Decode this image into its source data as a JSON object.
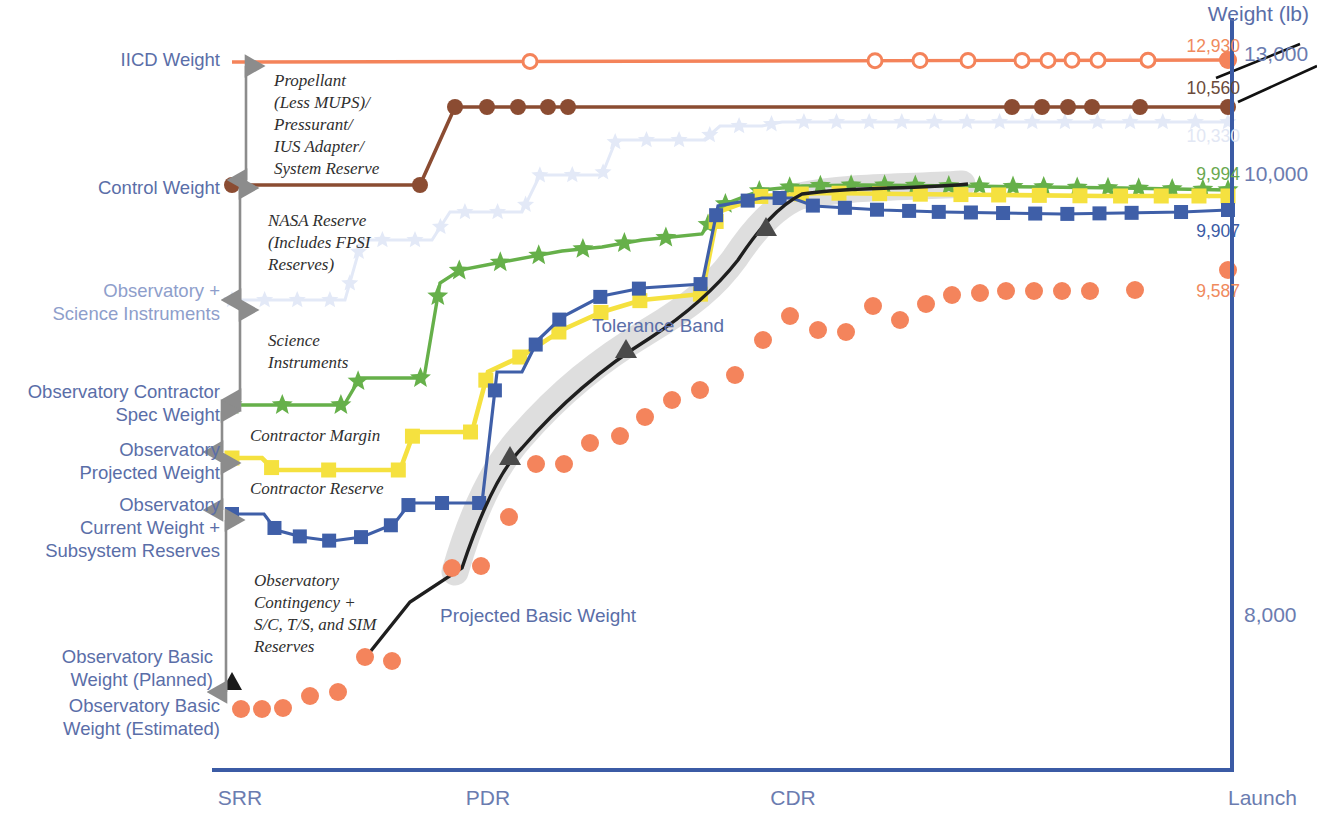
{
  "figure": {
    "axis_title": "Weight (lb)",
    "y_ticks": [
      {
        "label": "13,000",
        "y": 56
      },
      {
        "label": "10,000",
        "y": 176
      },
      {
        "label": "8,000",
        "y": 617
      }
    ],
    "x_ticks": [
      {
        "label": "SRR",
        "x": 240
      },
      {
        "label": "PDR",
        "x": 488
      },
      {
        "label": "CDR",
        "x": 793
      },
      {
        "label": "Launch",
        "x": 1258
      }
    ],
    "axis_color": "#3b5ba5"
  },
  "series_labels": [
    {
      "name": "iicd-weight",
      "text": "IICD Weight",
      "x": 28,
      "y": 48,
      "w": 192,
      "align": "right",
      "color": "#5a6ea8"
    },
    {
      "name": "control-weight",
      "text": "Control Weight",
      "x": 28,
      "y": 176,
      "w": 192,
      "align": "right",
      "color": "#5a6ea8"
    },
    {
      "name": "observatory-plus-si",
      "text": "Observatory +\nScience Instruments",
      "x": 0,
      "y": 279,
      "w": 220,
      "align": "right",
      "color": "#8e9ecb"
    },
    {
      "name": "contractor-spec-weight",
      "text": "Observatory Contractor\nSpec Weight",
      "x": 0,
      "y": 380,
      "w": 220,
      "align": "right",
      "color": "#5a6ea8"
    },
    {
      "name": "projected-weight",
      "text": "Observatory\nProjected Weight",
      "x": 0,
      "y": 438,
      "w": 220,
      "align": "right",
      "color": "#5a6ea8"
    },
    {
      "name": "current-weight",
      "text": "Observatory\nCurrent Weight +\nSubsystem Reserves",
      "x": 0,
      "y": 493,
      "w": 220,
      "align": "right",
      "color": "#5a6ea8"
    },
    {
      "name": "basic-weight-planned",
      "text": "Observatory Basic\nWeight (Planned)",
      "x": 0,
      "y": 645,
      "w": 213,
      "align": "right",
      "color": "#5a6ea8"
    },
    {
      "name": "basic-weight-estimated",
      "text": "Observatory Basic\nWeight (Estimated)",
      "x": 0,
      "y": 694,
      "w": 220,
      "align": "right",
      "color": "#5a6ea8"
    }
  ],
  "bracket_annotations": [
    {
      "name": "propellant-bracket",
      "text": "Propellant\n(Less MUPS)/\nPressurant/\nIUS Adapter/\nSystem Reserve",
      "x": 274,
      "y": 70,
      "top": 66,
      "bottom": 180
    },
    {
      "name": "nasa-reserve-bracket",
      "text": "NASA Reserve\n(Includes FPSI\nReserves)",
      "x": 268,
      "y": 210,
      "top": 188,
      "bottom": 300
    },
    {
      "name": "science-inst-bracket",
      "text": "Science\nInstruments",
      "x": 268,
      "y": 330,
      "top": 310,
      "bottom": 400
    },
    {
      "name": "contractor-margin-bracket",
      "text": "Contractor Margin",
      "x": 250,
      "y": 425,
      "top": 411,
      "bottom": 452
    },
    {
      "name": "contractor-reserve-bracket",
      "text": "Contractor Reserve",
      "x": 250,
      "y": 478,
      "top": 463,
      "bottom": 510
    },
    {
      "name": "observatory-contingency-bracket",
      "text": "Observatory\nContingency +\nS/C, T/S, and SIM\nReserves",
      "x": 254,
      "y": 570,
      "top": 520,
      "bottom": 692
    }
  ],
  "callouts": [
    {
      "name": "tolerance-band-label",
      "text": "Tolerance Band",
      "x": 592,
      "y": 315,
      "color": "#5a6ea8"
    },
    {
      "name": "projected-basic-weight-label",
      "text": "Projected Basic Weight",
      "x": 440,
      "y": 605,
      "color": "#5a6ea8"
    }
  ],
  "end_values": [
    {
      "name": "iicd-end-value",
      "text": "12,930",
      "x": 1130,
      "y": 36,
      "w": 110,
      "color": "#f08a5d"
    },
    {
      "name": "control-end-value",
      "text": "10,560",
      "x": 1130,
      "y": 78,
      "w": 110,
      "color": "#6b4a3a"
    },
    {
      "name": "ghost-end-value",
      "text": "10,330",
      "x": 1130,
      "y": 126,
      "w": 110,
      "color": "#e2e7f4"
    },
    {
      "name": "spec-end-value",
      "text": "9,994",
      "x": 1130,
      "y": 164,
      "w": 110,
      "color": "#6aa84f"
    },
    {
      "name": "current-end-value",
      "text": "9,907",
      "x": 1130,
      "y": 221,
      "w": 110,
      "color": "#3b5ba5"
    },
    {
      "name": "basic-end-value",
      "text": "9,587",
      "x": 1130,
      "y": 281,
      "w": 110,
      "color": "#f08a5d"
    }
  ],
  "colors": {
    "iicd_orange": "#f4835a",
    "control_brown": "#8b4c32",
    "ghost_blue": "#dfe6f5",
    "spec_green": "#66b04a",
    "projected_yellow": "#f5e13f",
    "current_blue": "#3f5fa8",
    "basic_orange": "#f4845c",
    "projected_black": "#1a1a1a",
    "tolerance_gray": "#d9d9d9",
    "bracket_gray": "#8c8c8c",
    "axis_blue": "#3b5ba5"
  },
  "chart_data": {
    "type": "line",
    "title": "",
    "xlabel": "",
    "ylabel": "Weight (lb)",
    "x_categories": [
      "SRR",
      "PDR",
      "CDR",
      "Launch"
    ],
    "y_tick_values": [
      13000,
      10000,
      8000
    ],
    "grid": false,
    "legend": "inline-left-labels",
    "series": [
      {
        "name": "IICD Weight",
        "color": "#f4835a",
        "marker": "open-circle",
        "end_value": 12930,
        "x": [
          240,
          262,
          284,
          306,
          328,
          350,
          372,
          394,
          416,
          438,
          460,
          482,
          504,
          526,
          548,
          570,
          592,
          614,
          636,
          658,
          680,
          702,
          724,
          746,
          768,
          790,
          812,
          834,
          856,
          878,
          900,
          922,
          944,
          966,
          988,
          1010,
          1032,
          1054,
          1076,
          1098,
          1120,
          1142,
          1164,
          1186,
          1208,
          1228
        ],
        "y": [
          12930,
          12930,
          12930,
          12930,
          12930,
          12930,
          12930,
          12930,
          12930,
          12930,
          12930,
          12930,
          12930,
          12930,
          12930,
          12930,
          12930,
          12930,
          12930,
          12930,
          12930,
          12930,
          12930,
          12930,
          12930,
          12930,
          12930,
          12930,
          12930,
          12930,
          12930,
          12930,
          12930,
          12930,
          12930,
          12930,
          12930,
          12930,
          12930,
          12930,
          12930,
          12930,
          12930,
          12930,
          12930,
          12930
        ],
        "marker_x": [
          530,
          875,
          920,
          968,
          1022,
          1048,
          1072,
          1098,
          1148,
          1228
        ]
      },
      {
        "name": "Control Weight",
        "color": "#8b4c32",
        "marker": "filled-circle",
        "end_value": 10560,
        "pixel_path": [
          [
            232,
            185
          ],
          [
            420,
            185
          ],
          [
            455,
            107
          ],
          [
            1228,
            107
          ]
        ],
        "marker_x": [
          232,
          420,
          455,
          487,
          518,
          548,
          568,
          1012,
          1042,
          1068,
          1092,
          1140,
          1228
        ],
        "marker_y": [
          185,
          185,
          107,
          107,
          107,
          107,
          107,
          107,
          107,
          107,
          107,
          107,
          107
        ]
      },
      {
        "name": "Observatory + Science Instruments",
        "color": "#dfe6f5",
        "marker": "star-faded",
        "end_value": 10330,
        "pixel_path": [
          [
            232,
            300
          ],
          [
            330,
            300
          ],
          [
            348,
            300
          ],
          [
            360,
            240
          ],
          [
            430,
            240
          ],
          [
            448,
            212
          ],
          [
            520,
            212
          ],
          [
            536,
            175
          ],
          [
            600,
            175
          ],
          [
            614,
            140
          ],
          [
            700,
            140
          ],
          [
            716,
            126
          ],
          [
            760,
            126
          ],
          [
            780,
            122
          ],
          [
            1228,
            122
          ]
        ]
      },
      {
        "name": "Observatory Contractor Spec Weight",
        "color": "#66b04a",
        "marker": "star",
        "end_value": 9994,
        "pixel_path": [
          [
            232,
            405
          ],
          [
            340,
            405
          ],
          [
            358,
            378
          ],
          [
            420,
            378
          ],
          [
            438,
            283
          ],
          [
            456,
            270
          ],
          [
            500,
            262
          ],
          [
            560,
            250
          ],
          [
            600,
            247
          ],
          [
            640,
            240
          ],
          [
            700,
            234
          ],
          [
            718,
            206
          ],
          [
            760,
            190
          ],
          [
            800,
            186
          ],
          [
            860,
            185
          ],
          [
            960,
            186
          ],
          [
            1040,
            187
          ],
          [
            1120,
            188
          ],
          [
            1228,
            190
          ]
        ],
        "marker_x": [
          232,
          282,
          340,
          358,
          420,
          438,
          460,
          500,
          540,
          582,
          624,
          666,
          708,
          726,
          760,
          790,
          820,
          852,
          884,
          916,
          948,
          980,
          1012,
          1044,
          1076,
          1108,
          1140,
          1172,
          1204,
          1228
        ]
      },
      {
        "name": "Observatory Projected Weight",
        "color": "#f5e13f",
        "marker": "square",
        "end_value": 9990,
        "pixel_path": [
          [
            232,
            458
          ],
          [
            260,
            458
          ],
          [
            272,
            470
          ],
          [
            398,
            470
          ],
          [
            412,
            432
          ],
          [
            470,
            432
          ],
          [
            486,
            372
          ],
          [
            520,
            356
          ],
          [
            560,
            330
          ],
          [
            600,
            312
          ],
          [
            640,
            300
          ],
          [
            700,
            294
          ],
          [
            716,
            212
          ],
          [
            760,
            196
          ],
          [
            820,
            193
          ],
          [
            900,
            194
          ],
          [
            1000,
            195
          ],
          [
            1100,
            196
          ],
          [
            1228,
            196
          ]
        ],
        "marker_x": [
          232,
          272,
          330,
          398,
          412,
          470,
          486,
          520,
          560,
          600,
          640,
          700,
          716,
          760,
          800,
          840,
          880,
          920,
          960,
          1000,
          1040,
          1080,
          1120,
          1160,
          1200,
          1228
        ]
      },
      {
        "name": "Observatory Current Weight + Subsystem Reserves",
        "color": "#3f5fa8",
        "marker": "square",
        "end_value": 9907,
        "pixel_path": [
          [
            232,
            514
          ],
          [
            262,
            514
          ],
          [
            274,
            530
          ],
          [
            300,
            537
          ],
          [
            330,
            541
          ],
          [
            360,
            537
          ],
          [
            392,
            524
          ],
          [
            408,
            503
          ],
          [
            480,
            503
          ],
          [
            495,
            372
          ],
          [
            520,
            372
          ],
          [
            536,
            340
          ],
          [
            560,
            317
          ],
          [
            600,
            296
          ],
          [
            640,
            288
          ],
          [
            700,
            284
          ],
          [
            716,
            206
          ],
          [
            760,
            198
          ],
          [
            790,
            198
          ],
          [
            812,
            206
          ],
          [
            880,
            210
          ],
          [
            940,
            212
          ],
          [
            1000,
            213
          ],
          [
            1060,
            214
          ],
          [
            1120,
            213
          ],
          [
            1180,
            212
          ],
          [
            1228,
            210
          ]
        ],
        "marker_x": [
          232,
          274,
          300,
          330,
          360,
          392,
          408,
          442,
          480,
          495,
          536,
          560,
          600,
          640,
          700,
          716,
          748,
          780,
          812,
          844,
          876,
          908,
          940,
          972,
          1004,
          1036,
          1068,
          1100,
          1132,
          1180,
          1228
        ]
      },
      {
        "name": "Observatory Basic Weight (Estimated)",
        "color": "#f4845c",
        "marker": "dot",
        "end_value": 9587,
        "points": [
          [
            241,
            709
          ],
          [
            262,
            709
          ],
          [
            283,
            708
          ],
          [
            310,
            696
          ],
          [
            338,
            692
          ],
          [
            365,
            657
          ],
          [
            392,
            661
          ],
          [
            452,
            568
          ],
          [
            481,
            566
          ],
          [
            509,
            517
          ],
          [
            536,
            464
          ],
          [
            564,
            464
          ],
          [
            590,
            443
          ],
          [
            620,
            436
          ],
          [
            645,
            417
          ],
          [
            672,
            400
          ],
          [
            700,
            390
          ],
          [
            735,
            375
          ],
          [
            763,
            340
          ],
          [
            790,
            316
          ],
          [
            818,
            330
          ],
          [
            846,
            332
          ],
          [
            873,
            306
          ],
          [
            900,
            320
          ],
          [
            926,
            304
          ],
          [
            952,
            295
          ],
          [
            980,
            293
          ],
          [
            1006,
            291
          ],
          [
            1034,
            291
          ],
          [
            1062,
            291
          ],
          [
            1090,
            291
          ],
          [
            1135,
            290
          ],
          [
            1228,
            270
          ]
        ]
      },
      {
        "name": "Observatory Basic Weight (Planned)",
        "color": "#1a1a1a",
        "marker": "triangle",
        "points": [
          [
            232,
            683
          ]
        ]
      },
      {
        "name": "Projected Basic Weight",
        "color": "#1a1a1a",
        "marker": "triangle-on-line",
        "pixel_path": [
          [
            366,
            657
          ],
          [
            408,
            602
          ],
          [
            460,
            568
          ],
          [
            478,
            520
          ],
          [
            500,
            470
          ],
          [
            520,
            450
          ],
          [
            560,
            405
          ],
          [
            600,
            370
          ],
          [
            640,
            345
          ],
          [
            680,
            322
          ],
          [
            700,
            310
          ],
          [
            720,
            290
          ],
          [
            744,
            262
          ],
          [
            760,
            230
          ],
          [
            780,
            205
          ],
          [
            800,
            192
          ],
          [
            860,
            188
          ],
          [
            900,
            190
          ],
          [
            968,
            186
          ]
        ],
        "marker_points": [
          [
            510,
            457
          ],
          [
            626,
            350
          ],
          [
            766,
            228
          ]
        ]
      }
    ],
    "tolerance_band": {
      "color": "#d9d9d9",
      "description": "Shaded gray band enveloping the Projected Basic Weight black line"
    }
  }
}
